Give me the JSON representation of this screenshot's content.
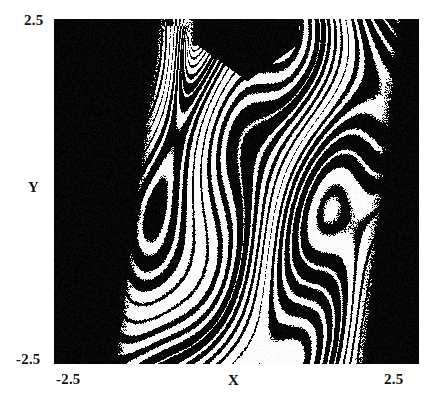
{
  "figure": {
    "kind": "fractal-basin-plot",
    "background_color": "#ffffff",
    "plot_background_color": "#050505",
    "foreground_color": "#ffffff",
    "text_color": "#111111"
  },
  "axes": {
    "x": {
      "label": "X",
      "min_tick": "-2.5",
      "max_tick": "2.5"
    },
    "y": {
      "label": "Y",
      "min_tick": "-2.5",
      "max_tick": "2.5"
    }
  },
  "chart_data": {
    "type": "heatmap",
    "title": "",
    "xlabel": "X",
    "ylabel": "Y",
    "xlim": [
      -2.5,
      2.5
    ],
    "ylim": [
      -2.5,
      2.5
    ],
    "xticks": [
      -2.5,
      2.5
    ],
    "yticks": [
      -2.5,
      2.5
    ],
    "xticklabels": [
      "-2.5",
      "2.5"
    ],
    "yticklabels": [
      "-2.5",
      "2.5"
    ],
    "grid": false,
    "legend": null,
    "colormap": [
      "#000000",
      "#ffffff"
    ],
    "field": {
      "resolution": [
        365,
        345
      ],
      "model": "nested-lobe-phase-field",
      "phase": {
        "scale_x": 3.25,
        "scale_y": 2.9,
        "shear": 0.62,
        "curvature": 1.35,
        "focus_x": -0.62,
        "focus_y": 2.4,
        "bands": 13,
        "dither_width": 0.06
      }
    }
  }
}
